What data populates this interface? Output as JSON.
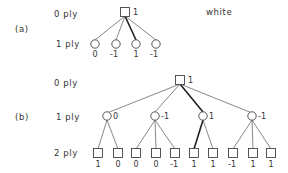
{
  "labels": {
    "a_tag": "(a)",
    "b_tag": "(b)",
    "a_ply0": "0 ply",
    "a_ply1": "1 ply",
    "b_ply0": "0 ply",
    "b_ply1": "1 ply",
    "b_ply2": "2 ply",
    "player": "white"
  },
  "tree_a": {
    "root": {
      "shape": "square",
      "value": "1"
    },
    "children": [
      {
        "shape": "circle",
        "value": "0",
        "best": false
      },
      {
        "shape": "circle",
        "value": "-1",
        "best": false
      },
      {
        "shape": "circle",
        "value": "1",
        "best": true
      },
      {
        "shape": "circle",
        "value": "-1",
        "best": false
      }
    ]
  },
  "tree_b": {
    "root": {
      "shape": "square",
      "value": "1"
    },
    "ply1": [
      {
        "shape": "circle",
        "value": "0",
        "best": false
      },
      {
        "shape": "circle",
        "value": "-1",
        "best": false
      },
      {
        "shape": "circle",
        "value": "1",
        "best": true
      },
      {
        "shape": "circle",
        "value": "-1",
        "best": false
      }
    ],
    "ply2": [
      {
        "shape": "square",
        "value": "1",
        "parent": 0
      },
      {
        "shape": "square",
        "value": "0",
        "parent": 0
      },
      {
        "shape": "square",
        "value": "0",
        "parent": 1
      },
      {
        "shape": "square",
        "value": "0",
        "parent": 1
      },
      {
        "shape": "square",
        "value": "-1",
        "parent": 1
      },
      {
        "shape": "square",
        "value": "1",
        "parent": 2,
        "best": true
      },
      {
        "shape": "square",
        "value": "1",
        "parent": 2
      },
      {
        "shape": "square",
        "value": "-1",
        "parent": 3
      },
      {
        "shape": "square",
        "value": "1",
        "parent": 3
      },
      {
        "shape": "square",
        "value": "1",
        "parent": 3
      }
    ]
  }
}
